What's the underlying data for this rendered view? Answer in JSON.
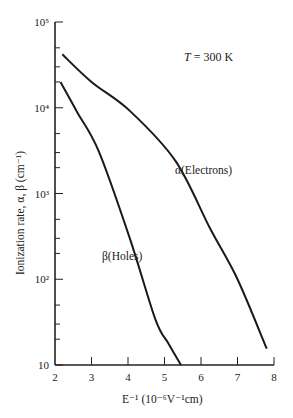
{
  "chart_data": {
    "type": "line",
    "title": "",
    "annotation": "T = 300 K",
    "xlabel": "E⁻¹ (10⁻⁶V⁻¹cm)",
    "ylabel": "Ionization rate, α, β (cm⁻¹)",
    "xlim": [
      2,
      8
    ],
    "ylim": [
      10,
      100000
    ],
    "yscale": "log",
    "grid": false,
    "x_ticks": [
      "2",
      "3",
      "4",
      "5",
      "6",
      "7",
      "8"
    ],
    "y_ticks": [
      "10",
      "10²",
      "10³",
      "10⁴",
      "10⁵"
    ],
    "series": [
      {
        "name": "α(Electrons)",
        "x": [
          2.2,
          3.0,
          4.05,
          5.3,
          6.25,
          7.0,
          7.8
        ],
        "y": [
          42000,
          20000,
          9200,
          2400,
          390,
          100,
          15.5
        ]
      },
      {
        "name": "β(Holes)",
        "x": [
          2.15,
          2.6,
          3.2,
          4.05,
          4.75,
          5.1,
          5.45
        ],
        "y": [
          20000,
          9000,
          3100,
          300,
          34,
          18,
          10
        ]
      }
    ]
  },
  "labels": {
    "temperature": "T = 300 K",
    "electrons": "α(Electrons)",
    "holes": "β(Holes)",
    "xlabel": "E⁻¹ (10⁻⁶V⁻¹cm)",
    "ylabel": "Ionization rate, α, β (cm⁻¹)"
  }
}
